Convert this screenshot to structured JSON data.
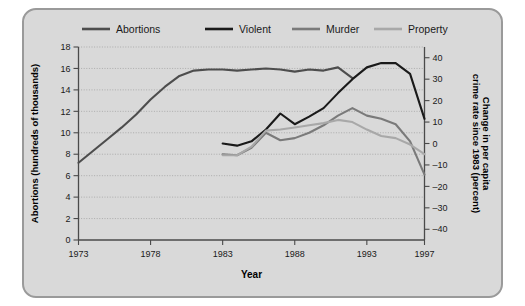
{
  "chart_data": {
    "type": "line",
    "title": "",
    "xlabel": "Year",
    "ylabel": "Abortions (hundreds of thousands)",
    "y2label": "Change in per capita crime rate since 1983 (percent)",
    "xlim": [
      1973,
      1997
    ],
    "ylim": [
      0,
      18
    ],
    "y2lim": [
      -45,
      45
    ],
    "grid": true,
    "legend_position": "top",
    "xticks": [
      1973,
      1978,
      1983,
      1988,
      1993,
      1997
    ],
    "xtick_labels": [
      "1973",
      "1978",
      "1983",
      "1988",
      "1993",
      "1997"
    ],
    "yticks": [
      0,
      2,
      4,
      6,
      8,
      10,
      12,
      14,
      16,
      18
    ],
    "ytick_labels": [
      "0",
      "2",
      "4",
      "6",
      "8",
      "10",
      "12",
      "14",
      "16",
      "18"
    ],
    "y2ticks": [
      -40,
      -30,
      -20,
      -10,
      0,
      10,
      20,
      30,
      40
    ],
    "y2tick_labels": [
      "–40",
      "–30",
      "–20",
      "–10",
      "0",
      "10",
      "20",
      "30",
      "40"
    ],
    "series": [
      {
        "name": "Abortions",
        "color": "#4d4d4d",
        "axis": "left",
        "x": [
          1973,
          1974,
          1975,
          1976,
          1977,
          1978,
          1979,
          1980,
          1981,
          1982,
          1983,
          1984,
          1985,
          1986,
          1987,
          1988,
          1989,
          1990,
          1991,
          1992
        ],
        "values": [
          7.2,
          8.3,
          9.4,
          10.5,
          11.7,
          13.1,
          14.3,
          15.3,
          15.8,
          15.9,
          15.9,
          15.8,
          15.9,
          16.0,
          15.9,
          15.7,
          15.9,
          15.8,
          16.1,
          15.1
        ]
      },
      {
        "name": "Violent",
        "color": "#1a1a1a",
        "axis": "right",
        "x": [
          1983,
          1984,
          1985,
          1986,
          1987,
          1988,
          1989,
          1990,
          1991,
          1992,
          1993,
          1994,
          1995,
          1996,
          1997
        ],
        "values": [
          9.1,
          8.9,
          9.3,
          10.4,
          11.9,
          10.9,
          11.6,
          12.4,
          13.8,
          15.1,
          16.2,
          16.6,
          16.6,
          15.6,
          11.4
        ],
        "values_right_axis": [
          0.0,
          -1.0,
          1.0,
          6.5,
          14.0,
          9.0,
          12.5,
          16.5,
          23.5,
          30.0,
          35.5,
          37.5,
          37.5,
          32.5,
          11.5
        ]
      },
      {
        "name": "Murder",
        "color": "#7a7a7a",
        "axis": "right",
        "x": [
          1983,
          1984,
          1985,
          1986,
          1987,
          1988,
          1989,
          1990,
          1991,
          1992,
          1993,
          1994,
          1995,
          1996,
          1997
        ],
        "values": [
          8.0,
          7.9,
          8.6,
          10.0,
          9.3,
          9.5,
          10.0,
          10.7,
          11.6,
          12.3,
          11.6,
          11.3,
          10.9,
          9.4,
          6.2
        ],
        "values_right_axis": [
          -5.0,
          -5.5,
          -2.0,
          5.0,
          1.5,
          2.5,
          5.0,
          8.5,
          13.0,
          16.5,
          13.0,
          11.5,
          9.0,
          1.0,
          -14.5
        ]
      },
      {
        "name": "Property",
        "color": "#a8a8a8",
        "axis": "right",
        "x": [
          1983,
          1984,
          1985,
          1986,
          1987,
          1988,
          1989,
          1990,
          1991,
          1992,
          1993,
          1994,
          1995,
          1996,
          1997
        ],
        "values": [
          7.9,
          7.9,
          8.7,
          10.2,
          10.3,
          10.5,
          10.7,
          10.9,
          11.2,
          11.0,
          10.3,
          9.7,
          9.5,
          8.9,
          8.0
        ],
        "values_right_axis": [
          -5.5,
          -5.5,
          -1.5,
          6.0,
          6.5,
          7.5,
          8.5,
          9.5,
          11.0,
          10.0,
          6.5,
          3.5,
          2.5,
          -0.5,
          -5.0
        ]
      }
    ]
  },
  "legend": {
    "items": [
      {
        "label": "Abortions",
        "color": "#4d4d4d"
      },
      {
        "label": "Violent",
        "color": "#1a1a1a"
      },
      {
        "label": "Murder",
        "color": "#7a7a7a"
      },
      {
        "label": "Property",
        "color": "#a8a8a8"
      }
    ]
  },
  "axes": {
    "left_title": "Abortions (hundreds of thousands)",
    "right_title": "Change in per capita crime rate since 1983 (percent)",
    "bottom_title": "Year"
  }
}
